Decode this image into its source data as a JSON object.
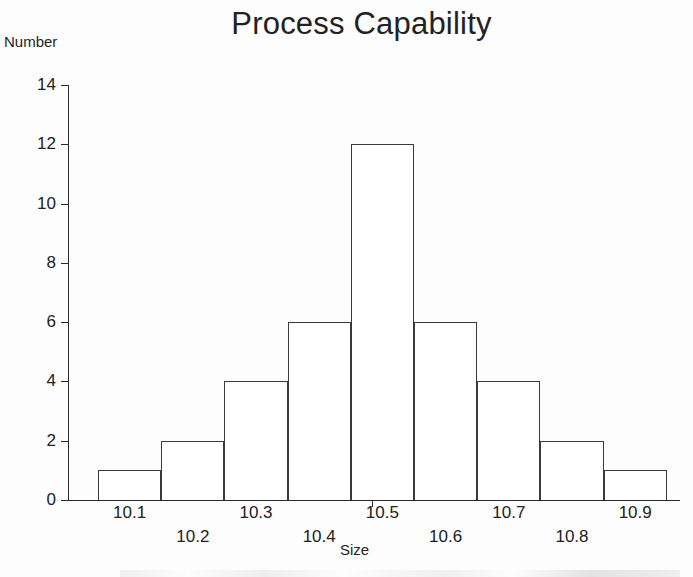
{
  "chart_data": {
    "type": "bar",
    "title": "Process Capability",
    "xlabel": "Size",
    "ylabel": "Number",
    "categories": [
      "10.1",
      "10.2",
      "10.3",
      "10.4",
      "10.5",
      "10.6",
      "10.7",
      "10.8",
      "10.9"
    ],
    "values": [
      1,
      2,
      4,
      6,
      12,
      6,
      4,
      2,
      1
    ],
    "ylim": [
      0,
      14
    ],
    "ytick_labels": [
      "0",
      "2",
      "4",
      "6",
      "8",
      "10",
      "12",
      "14"
    ],
    "ytick_values": [
      0,
      2,
      4,
      6,
      8,
      10,
      12,
      14
    ],
    "grid": false,
    "legend": false,
    "bar_fill_color": "#ffffff",
    "bar_border_color": "#3a3a3a",
    "axis_color": "#2a2a2a",
    "text_color": "#222222",
    "background_color": "#fdfdfd"
  }
}
